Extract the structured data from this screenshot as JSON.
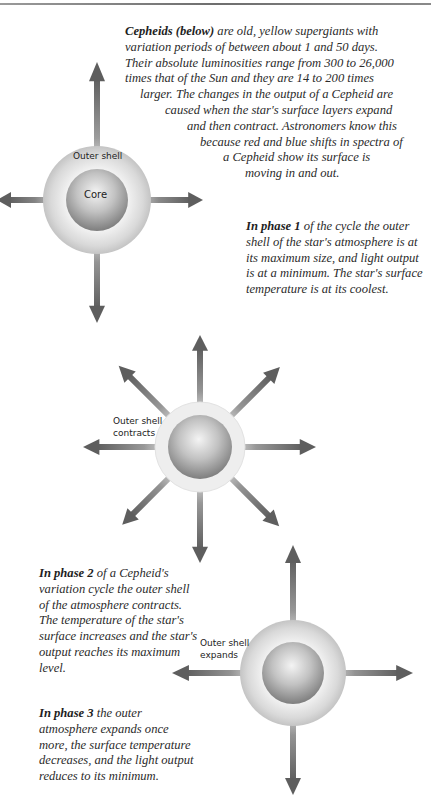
{
  "intro": {
    "lead_bold": "Cepheids (below)",
    "lines": [
      " are old, yellow supergiants with",
      "variation periods of between about 1 and 50 days.",
      "Their absolute luminosities range from 300 to 26,000",
      "times that of the Sun and they are 14 to 200 times",
      "larger. The changes in the output of a Cepheid are",
      "caused when the star's surface layers expand",
      "and then contract. Astronomers know this",
      "because red and blue shifts in spectra of",
      "a Cepheid show its surface is",
      "moving in and out."
    ]
  },
  "phase1": {
    "lead_bold": "In phase 1",
    "text": " of the cycle the outer shell of the star's atmosphere is at its maximum size, and light output is at a minimum. The star's surface temperature is at its coolest.",
    "labels": {
      "shell": "Outer shell",
      "core": "Core"
    }
  },
  "phase2": {
    "lead_bold": "In phase 2",
    "text": " of a Cepheid's variation cycle the outer shell of the atmosphere contracts. The temperature of the star's surface increases and the star's output reaches its maximum level.",
    "labels": {
      "shell_line1": "Outer shell",
      "shell_line2": "contracts"
    }
  },
  "phase3": {
    "lead_bold": "In phase 3",
    "text": " the outer atmosphere expands once more, the surface temperature decreases, and the light output reduces to its minimum.",
    "labels": {
      "shell_line1": "Outer shell",
      "shell_line2": "expands"
    }
  },
  "colors": {
    "arrow": "#6f6f6f",
    "rule": "#7a7a7a",
    "shell": "#d6d6d6",
    "core_dark": "#8a8a8a"
  }
}
